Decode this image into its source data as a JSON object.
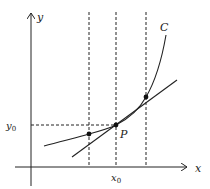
{
  "diagram": {
    "labels": {
      "y_axis": "y",
      "x_axis": "x",
      "curve": "C",
      "point": "P",
      "x0": "x",
      "x0_sub": "0",
      "y0": "y",
      "y0_sub": "0"
    },
    "colors": {
      "stroke": "#222222",
      "background": "#ffffff"
    }
  }
}
